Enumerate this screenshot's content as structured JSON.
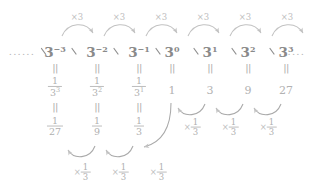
{
  "diagram": {
    "accent_color": "#8d8d8d",
    "leading_dots": "......",
    "trailing_dots": "......",
    "equals_sign": "||",
    "multiply_symbol": "×",
    "top_arrow_label": "×3",
    "bottom_arrow_label_times": "×",
    "bottom_arrow_numerator": "1",
    "bottom_arrow_denominator": "3",
    "columns": [
      {
        "id": "col-3-neg3",
        "power_base": "3",
        "power_exponent": "−3",
        "equals_top": "||",
        "fraction_numerator": "1",
        "fraction_denominator_base": "3",
        "fraction_denominator_exponent": "3",
        "equals_bottom": "||",
        "value_numerator": "1",
        "value_denominator": "27",
        "value_plain": null
      },
      {
        "id": "col-3-neg2",
        "power_base": "3",
        "power_exponent": "−2",
        "equals_top": "||",
        "fraction_numerator": "1",
        "fraction_denominator_base": "3",
        "fraction_denominator_exponent": "2",
        "equals_bottom": "||",
        "value_numerator": "1",
        "value_denominator": "9",
        "value_plain": null
      },
      {
        "id": "col-3-neg1",
        "power_base": "3",
        "power_exponent": "−1",
        "equals_top": "||",
        "fraction_numerator": "1",
        "fraction_denominator_base": "3",
        "fraction_denominator_exponent": "1",
        "equals_bottom": "||",
        "value_numerator": "1",
        "value_denominator": "3",
        "value_plain": null
      },
      {
        "id": "col-3-0",
        "power_base": "3",
        "power_exponent": "0",
        "equals_top": "||",
        "fraction_numerator": null,
        "fraction_denominator_base": null,
        "fraction_denominator_exponent": null,
        "equals_bottom": null,
        "value_numerator": null,
        "value_denominator": null,
        "value_plain": "1"
      },
      {
        "id": "col-3-1",
        "power_base": "3",
        "power_exponent": "1",
        "equals_top": "||",
        "fraction_numerator": null,
        "fraction_denominator_base": null,
        "fraction_denominator_exponent": null,
        "equals_bottom": null,
        "value_numerator": null,
        "value_denominator": null,
        "value_plain": "3"
      },
      {
        "id": "col-3-2",
        "power_base": "3",
        "power_exponent": "2",
        "equals_top": "||",
        "fraction_numerator": null,
        "fraction_denominator_base": null,
        "fraction_denominator_exponent": null,
        "equals_bottom": null,
        "value_numerator": null,
        "value_denominator": null,
        "value_plain": "9"
      },
      {
        "id": "col-3-3",
        "power_base": "3",
        "power_exponent": "3",
        "equals_top": "||",
        "fraction_numerator": null,
        "fraction_denominator_base": null,
        "fraction_denominator_exponent": null,
        "equals_bottom": null,
        "value_numerator": null,
        "value_denominator": null,
        "value_plain": "27"
      }
    ],
    "top_arrows": [
      {
        "id": "arrow-mul3-1",
        "label": "×3"
      },
      {
        "id": "arrow-mul3-2",
        "label": "×3"
      },
      {
        "id": "arrow-mul3-3",
        "label": "×3"
      },
      {
        "id": "arrow-mul3-4",
        "label": "×3"
      },
      {
        "id": "arrow-mul3-5",
        "label": "×3"
      },
      {
        "id": "arrow-mul3-6",
        "label": "×3"
      }
    ],
    "bottom_arrows_upper": [
      {
        "id": "arrow-div3-u1",
        "times": "×",
        "num": "1",
        "den": "3"
      },
      {
        "id": "arrow-div3-u2",
        "times": "×",
        "num": "1",
        "den": "3"
      },
      {
        "id": "arrow-div3-u3",
        "times": "×",
        "num": "1",
        "den": "3"
      }
    ],
    "bottom_arrows_lower": [
      {
        "id": "arrow-div3-l1",
        "times": "×",
        "num": "1",
        "den": "3"
      },
      {
        "id": "arrow-div3-l2",
        "times": "×",
        "num": "1",
        "den": "3"
      },
      {
        "id": "arrow-div3-l3",
        "times": "×",
        "num": "1",
        "den": "3"
      }
    ]
  }
}
